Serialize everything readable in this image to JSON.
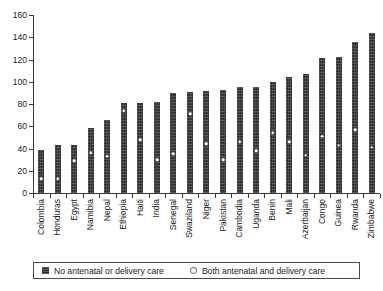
{
  "chart_data": {
    "type": "bar",
    "title": "",
    "subtitle": "",
    "xlabel": "",
    "ylabel": "",
    "ylim": [
      0,
      160
    ],
    "ytick_step": 20,
    "yticks": [
      0,
      20,
      40,
      60,
      80,
      100,
      120,
      140,
      160
    ],
    "grid": false,
    "legend_position": "bottom",
    "categories": [
      "Colombia",
      "Honduras",
      "Egypt",
      "Namibia",
      "Nepal",
      "Ethiopia",
      "Haiti",
      "India",
      "Senegal",
      "Swaziland",
      "Niger",
      "Pakistan",
      "Cambodia",
      "Uganda",
      "Benin",
      "Mali",
      "Azerbaijan",
      "Congo",
      "Guinea",
      "Rwanda",
      "Zimbabwe"
    ],
    "series": [
      {
        "name": "No antenatal or delivery care",
        "marker": "square",
        "color": "#2e2e2e",
        "values": [
          39,
          43,
          43,
          58,
          66,
          81,
          81,
          82,
          90,
          91,
          92,
          93,
          95,
          95,
          100,
          104,
          107,
          121,
          122,
          136,
          144
        ]
      },
      {
        "name": "Both antenatal and delivery care",
        "marker": "circle",
        "color": "#ffffff",
        "values": [
          13,
          13,
          29,
          36,
          33,
          74,
          48,
          30,
          35,
          71,
          44,
          30,
          46,
          38,
          54,
          46,
          34,
          51,
          43,
          57,
          41
        ]
      }
    ]
  },
  "legend": {
    "items": [
      {
        "label": "No antenatal or delivery care",
        "swatch": "filled-square"
      },
      {
        "label": "Both antenatal and delivery care",
        "swatch": "open-circle"
      }
    ]
  },
  "colors": {
    "bar": "#2e2e2e",
    "marker_fill": "#ffffff",
    "marker_edge": "#3f3f3f",
    "axis": "#3a3a3a",
    "text": "#1a1a1a",
    "background": "#ffffff"
  }
}
